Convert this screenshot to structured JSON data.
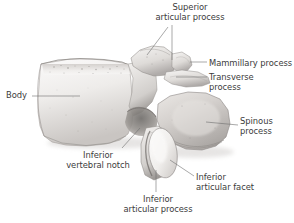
{
  "figure": {
    "background_color": "#ffffff",
    "label_color": "#3b3b3b",
    "bone_light": "#f4f2f0",
    "bone_mid": "#d8d5d2",
    "bone_shadow": "#a9a5a2",
    "leader_color": "#6e6e6e"
  },
  "labels": {
    "superior_articular_process": "Superior\narticular process",
    "mammillary_process": "Mammillary process",
    "transverse_process": "Transverse\nprocess",
    "spinous_process": "Spinous\nprocess",
    "body": "Body",
    "inferior_vertebral_notch": "Inferior\nvertebral notch",
    "inferior_articular_process": "Inferior\narticular process",
    "inferior_articular_facet": "Inferior\narticular facet"
  }
}
